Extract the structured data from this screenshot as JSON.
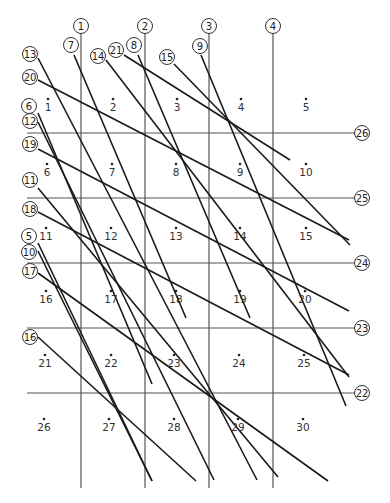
{
  "diagram": {
    "title": "",
    "vertical_lines": [
      {
        "id": "1",
        "x": 81,
        "y1": 34,
        "y2": 488
      },
      {
        "id": "2",
        "x": 145,
        "y1": 34,
        "y2": 488
      },
      {
        "id": "3",
        "x": 209,
        "y1": 34,
        "y2": 488
      },
      {
        "id": "4",
        "x": 273,
        "y1": 34,
        "y2": 488
      }
    ],
    "horizontal_lines": [
      {
        "id": "26",
        "y": 133,
        "x1": 27,
        "x2": 355
      },
      {
        "id": "25",
        "y": 198,
        "x1": 27,
        "x2": 355
      },
      {
        "id": "24",
        "y": 263,
        "x1": 27,
        "x2": 355
      },
      {
        "id": "23",
        "y": 328,
        "x1": 27,
        "x2": 355
      },
      {
        "id": "22",
        "y": 393,
        "x1": 27,
        "x2": 355
      }
    ],
    "diagonal_lines": [
      {
        "id": "7",
        "label_x": 71,
        "label_y": 45,
        "x1": 74,
        "y1": 55,
        "x2": 186,
        "y2": 318
      },
      {
        "id": "8",
        "label_x": 134,
        "label_y": 45,
        "x1": 138,
        "y1": 55,
        "x2": 250,
        "y2": 318
      },
      {
        "id": "9",
        "label_x": 200,
        "label_y": 46,
        "x1": 201,
        "y1": 55,
        "x2": 346,
        "y2": 406
      },
      {
        "id": "6",
        "label_x": 29,
        "label_y": 106,
        "x1": 38,
        "y1": 113,
        "x2": 152,
        "y2": 384
      },
      {
        "id": "10",
        "label_x": 29,
        "label_y": 252,
        "x1": 38,
        "y1": 251,
        "x2": 152,
        "y2": 481
      },
      {
        "id": "5",
        "label_x": 29,
        "label_y": 236,
        "x1": 38,
        "y1": 243,
        "x2": 152,
        "y2": 481
      },
      {
        "id": "12",
        "label_x": 30,
        "label_y": 121,
        "x1": 38,
        "y1": 122,
        "x2": 214,
        "y2": 480
      },
      {
        "id": "13",
        "label_x": 30,
        "label_y": 54,
        "x1": 38,
        "y1": 58,
        "x2": 257,
        "y2": 480
      },
      {
        "id": "14",
        "label_x": 98,
        "label_y": 56,
        "x1": 106,
        "y1": 60,
        "x2": 349,
        "y2": 377
      },
      {
        "id": "15",
        "label_x": 167,
        "label_y": 57,
        "x1": 174,
        "y1": 64,
        "x2": 350,
        "y2": 245
      },
      {
        "id": "11",
        "label_x": 30,
        "label_y": 180,
        "x1": 38,
        "y1": 188,
        "x2": 278,
        "y2": 477
      },
      {
        "id": "16",
        "label_x": 30,
        "label_y": 337,
        "x1": 38,
        "y1": 337,
        "x2": 196,
        "y2": 481
      },
      {
        "id": "17",
        "label_x": 30,
        "label_y": 271,
        "x1": 38,
        "y1": 273,
        "x2": 328,
        "y2": 481
      },
      {
        "id": "18",
        "label_x": 30,
        "label_y": 209,
        "x1": 38,
        "y1": 212,
        "x2": 349,
        "y2": 375
      },
      {
        "id": "19",
        "label_x": 30,
        "label_y": 144,
        "x1": 38,
        "y1": 149,
        "x2": 349,
        "y2": 311
      },
      {
        "id": "20",
        "label_x": 30,
        "label_y": 77,
        "x1": 38,
        "y1": 80,
        "x2": 349,
        "y2": 240
      },
      {
        "id": "21",
        "label_x": 116,
        "label_y": 50,
        "x1": 124,
        "y1": 55,
        "x2": 290,
        "y2": 160
      }
    ],
    "cells": [
      {
        "n": "1",
        "x": 48,
        "y": 111
      },
      {
        "n": "2",
        "x": 113,
        "y": 111
      },
      {
        "n": "3",
        "x": 177,
        "y": 111
      },
      {
        "n": "4",
        "x": 241,
        "y": 111
      },
      {
        "n": "5",
        "x": 306,
        "y": 111
      },
      {
        "n": "6",
        "x": 47,
        "y": 176
      },
      {
        "n": "7",
        "x": 112,
        "y": 176
      },
      {
        "n": "8",
        "x": 176,
        "y": 176
      },
      {
        "n": "9",
        "x": 240,
        "y": 176
      },
      {
        "n": "10",
        "x": 306,
        "y": 176
      },
      {
        "n": "11",
        "x": 46,
        "y": 240
      },
      {
        "n": "12",
        "x": 111,
        "y": 240
      },
      {
        "n": "13",
        "x": 176,
        "y": 240
      },
      {
        "n": "14",
        "x": 240,
        "y": 240
      },
      {
        "n": "15",
        "x": 306,
        "y": 240
      },
      {
        "n": "16",
        "x": 46,
        "y": 303
      },
      {
        "n": "17",
        "x": 111,
        "y": 303
      },
      {
        "n": "18",
        "x": 176,
        "y": 303
      },
      {
        "n": "19",
        "x": 240,
        "y": 303
      },
      {
        "n": "20",
        "x": 305,
        "y": 303
      },
      {
        "n": "21",
        "x": 45,
        "y": 367
      },
      {
        "n": "22",
        "x": 111,
        "y": 367
      },
      {
        "n": "23",
        "x": 174,
        "y": 367
      },
      {
        "n": "24",
        "x": 239,
        "y": 367
      },
      {
        "n": "25",
        "x": 304,
        "y": 367
      },
      {
        "n": "26",
        "x": 44,
        "y": 431
      },
      {
        "n": "27",
        "x": 109,
        "y": 431
      },
      {
        "n": "28",
        "x": 174,
        "y": 431
      },
      {
        "n": "29",
        "x": 238,
        "y": 431
      },
      {
        "n": "30",
        "x": 303,
        "y": 431
      }
    ]
  }
}
